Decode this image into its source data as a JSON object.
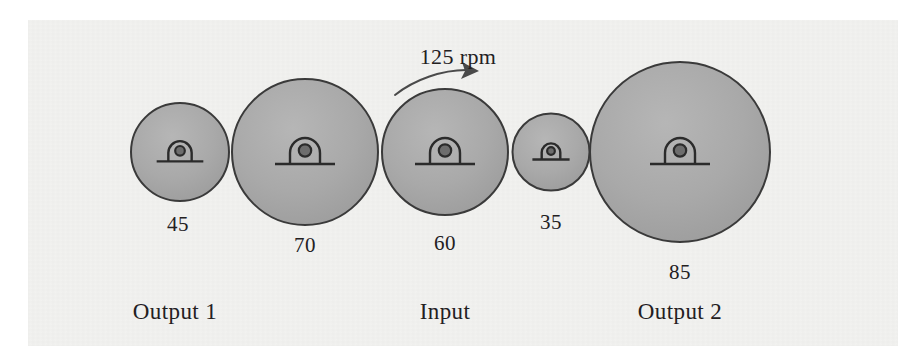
{
  "figure": {
    "background_color": "#f2f2f0",
    "page_color": "#ffffff",
    "gear_fill_color": "#a8a8a8",
    "gear_stroke_color": "#3a3a3a",
    "text_color": "#23201f"
  },
  "annotation": {
    "speed_label": "125 rpm",
    "speed_label_x": 458,
    "speed_label_y": 57,
    "arrow_name": "clockwise-rotation-arrow"
  },
  "gears": [
    {
      "id": "gear-45",
      "tooth_count_label": "45",
      "teeth": 45,
      "cx": 180,
      "cy": 152,
      "r": 49,
      "label_x": 178,
      "label_y": 224
    },
    {
      "id": "gear-70",
      "tooth_count_label": "70",
      "teeth": 70,
      "cx": 305,
      "cy": 152,
      "r": 73,
      "label_x": 305,
      "label_y": 245
    },
    {
      "id": "gear-60",
      "tooth_count_label": "60",
      "teeth": 60,
      "cx": 445,
      "cy": 152,
      "r": 63,
      "label_x": 445,
      "label_y": 243
    },
    {
      "id": "gear-35",
      "tooth_count_label": "35",
      "teeth": 35,
      "cx": 551,
      "cy": 152,
      "r": 38.5,
      "label_x": 551,
      "label_y": 222
    },
    {
      "id": "gear-85",
      "tooth_count_label": "85",
      "teeth": 85,
      "cx": 680,
      "cy": 152,
      "r": 90,
      "label_x": 680,
      "label_y": 272
    }
  ],
  "stations": [
    {
      "id": "station-output-1",
      "caption": "Output 1",
      "x": 175,
      "y": 312
    },
    {
      "id": "station-input",
      "caption": "Input",
      "x": 445,
      "y": 312
    },
    {
      "id": "station-output-2",
      "caption": "Output 2",
      "x": 680,
      "y": 312
    }
  ],
  "chart_data": {
    "type": "diagram",
    "subtype": "gear-train-schematic",
    "units": "teeth",
    "categories": [
      "45",
      "70",
      "60",
      "35",
      "85"
    ],
    "values": [
      45,
      70,
      60,
      35,
      85
    ],
    "input_speed_rpm": 125,
    "input_gear": "60",
    "output_gears": [
      "45",
      "85"
    ]
  }
}
